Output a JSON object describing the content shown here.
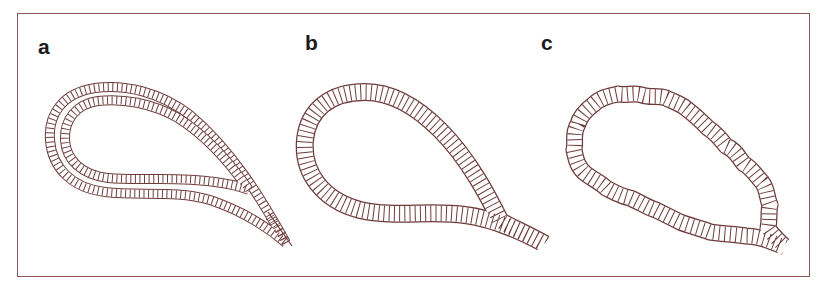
{
  "figure": {
    "panels": [
      {
        "id": "a",
        "label": "a",
        "description": "teardrop outline with double ticked band, pointed tail"
      },
      {
        "id": "b",
        "label": "b",
        "description": "teardrop outline with single wide ticked band, open tail"
      },
      {
        "id": "c",
        "label": "c",
        "description": "irregular wavy teardrop outline with ticked band, open tail"
      }
    ],
    "colors": {
      "stroke": "#6e3b3b",
      "frame": "#8a5a5a",
      "background": "#ffffff",
      "label": "#1a1a1a"
    }
  }
}
